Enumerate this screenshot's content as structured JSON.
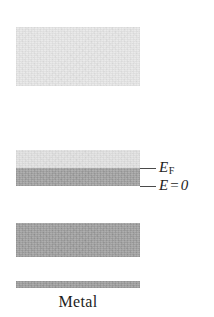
{
  "figure": {
    "caption": "Metal",
    "background_color": "#ffffff"
  },
  "bands": [
    {
      "id": "block-top",
      "name": "upper-vacuum-band",
      "fill_color": "#e9e9e9",
      "x": 16,
      "y": 27,
      "width": 124,
      "height": 59
    },
    {
      "id": "block-mid-light",
      "name": "unoccupied-states-band",
      "fill_color": "#e4e4e4",
      "x": 16,
      "y": 150,
      "width": 124,
      "height": 18
    },
    {
      "id": "block-mid-dark",
      "name": "occupied-conduction-band",
      "fill_color": "#a8a8a8",
      "x": 16,
      "y": 168,
      "width": 124,
      "height": 18
    },
    {
      "id": "block-third",
      "name": "lower-filled-band",
      "fill_color": "#a6a6a6",
      "x": 16,
      "y": 223,
      "width": 124,
      "height": 34
    },
    {
      "id": "block-bar",
      "name": "core-level-band",
      "fill_color": "#a4a4a4",
      "x": 16,
      "y": 281,
      "width": 124,
      "height": 7
    }
  ],
  "labels": {
    "fermi_level": {
      "symbol": "E",
      "subscript": "F",
      "leader_color": "#4a4a4a",
      "text_color": "#1d1d1d"
    },
    "energy_zero": {
      "symbol": "E",
      "equals": "=",
      "value": "0",
      "leader_color": "#4a4a4a",
      "text_color": "#1d1d1d"
    }
  },
  "chart_data": {
    "type": "bar",
    "title": "Metal",
    "xlabel": "",
    "ylabel": "E",
    "orientation": "horizontal-bands",
    "grid": false,
    "legend": null,
    "annotations": [
      {
        "label": "E_F",
        "y": 168,
        "description": "Fermi level, top edge of the filled conduction band"
      },
      {
        "label": "E = 0",
        "y": 186,
        "description": "Energy zero, bottom edge of the filled conduction band"
      }
    ],
    "categories": [
      "upper-vacuum-band",
      "unoccupied-states-band",
      "occupied-conduction-band",
      "lower-filled-band",
      "core-level-band"
    ],
    "series": [
      {
        "name": "band thickness (px)",
        "values": [
          59,
          18,
          18,
          34,
          7
        ]
      },
      {
        "name": "band top position (px from image top)",
        "values": [
          27,
          150,
          168,
          223,
          281
        ]
      },
      {
        "name": "fill darkness (0=white, 1=black)",
        "values": [
          0.09,
          0.11,
          0.34,
          0.35,
          0.36
        ]
      }
    ]
  }
}
